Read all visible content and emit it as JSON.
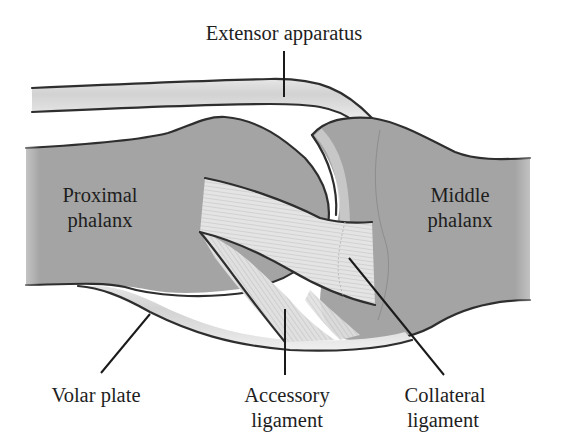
{
  "diagram": {
    "labels": {
      "extensor_apparatus": "Extensor apparatus",
      "proximal_phalanx_line1": "Proximal",
      "proximal_phalanx_line2": "phalanx",
      "middle_phalanx_line1": "Middle",
      "middle_phalanx_line2": "phalanx",
      "volar_plate": "Volar plate",
      "accessory_ligament_line1": "Accessory",
      "accessory_ligament_line2": "ligament",
      "collateral_ligament_line1": "Collateral",
      "collateral_ligament_line2": "ligament"
    },
    "colors": {
      "background": "#ffffff",
      "bone": "#a4a4a4",
      "outline": "#2e2e2e",
      "tendon": "#dcdcdc",
      "ligament": "#e2e2e2",
      "text": "#1e1e1e"
    }
  }
}
